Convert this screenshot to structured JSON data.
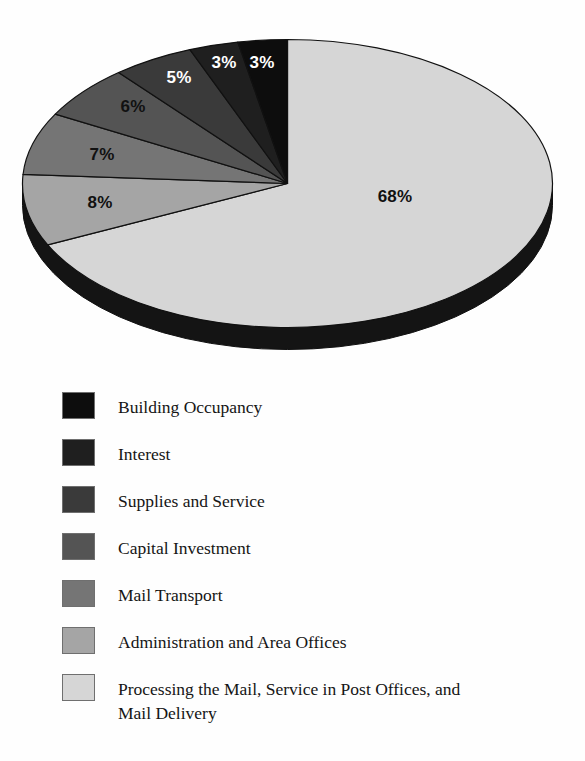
{
  "chart_data": {
    "type": "pie",
    "title": "",
    "subtitle": "",
    "xlabel": "",
    "ylabel": "",
    "legend_position": "bottom",
    "style": "3d-pie",
    "unit": "%",
    "categories": [
      "Building Occupancy",
      "Interest",
      "Supplies and Service",
      "Capital Investment",
      "Mail Transport",
      "Administration and Area Offices",
      "Processing the Mail, Service in Post Offices, and Mail Delivery"
    ],
    "values": [
      3,
      3,
      5,
      6,
      7,
      8,
      68
    ],
    "value_labels": [
      "3%",
      "3%",
      "5%",
      "6%",
      "7%",
      "8%",
      "68%"
    ],
    "colors": [
      "#0d0d0d",
      "#1f1f1f",
      "#3a3a3a",
      "#545454",
      "#757575",
      "#a5a5a5",
      "#d6d6d6"
    ]
  },
  "pie": {
    "depth_color": "#141414",
    "outline_color": "#111111",
    "slices": [
      {
        "label": "68%",
        "value": 68,
        "color": "#d6d6d6",
        "label_color": "dark",
        "label_x": 395,
        "label_y": 197
      },
      {
        "label": "8%",
        "value": 8,
        "color": "#a5a5a5",
        "label_color": "dark",
        "label_x": 100,
        "label_y": 203
      },
      {
        "label": "7%",
        "value": 7,
        "color": "#757575",
        "label_color": "dark",
        "label_x": 102,
        "label_y": 155
      },
      {
        "label": "6%",
        "value": 6,
        "color": "#545454",
        "label_color": "dark",
        "label_x": 133,
        "label_y": 107
      },
      {
        "label": "5%",
        "value": 5,
        "color": "#3a3a3a",
        "label_color": "light",
        "label_x": 179,
        "label_y": 78
      },
      {
        "label": "3%",
        "value": 3,
        "color": "#1f1f1f",
        "label_color": "light",
        "label_x": 224,
        "label_y": 63
      },
      {
        "label": "3%",
        "value": 3,
        "color": "#0d0d0d",
        "label_color": "light",
        "label_x": 262,
        "label_y": 63
      }
    ]
  },
  "legend": {
    "items": [
      {
        "label": "Building Occupancy",
        "color": "#0d0d0d",
        "y": 0,
        "lines": 1
      },
      {
        "label": "Interest",
        "color": "#1f1f1f",
        "y": 47,
        "lines": 1
      },
      {
        "label": "Supplies and Service",
        "color": "#3a3a3a",
        "y": 94,
        "lines": 1
      },
      {
        "label": "Capital Investment",
        "color": "#545454",
        "y": 141,
        "lines": 1
      },
      {
        "label": "Mail Transport",
        "color": "#757575",
        "y": 188,
        "lines": 1
      },
      {
        "label": "Administration and Area Offices",
        "color": "#a5a5a5",
        "y": 235,
        "lines": 1
      },
      {
        "label": "Processing the Mail, Service in Post Offices, and\nMail Delivery",
        "color": "#d6d6d6",
        "y": 282,
        "lines": 2
      }
    ]
  }
}
